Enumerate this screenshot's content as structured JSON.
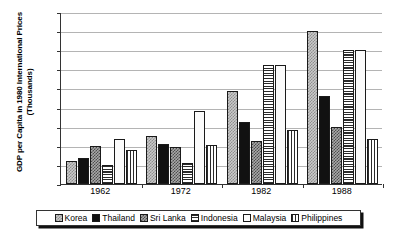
{
  "chart_data": {
    "type": "bar",
    "title": "",
    "subtitle": "",
    "xlabel": "",
    "ylabel": "GDP per Capita in 1980 International Prices",
    "ylabel_line2": "(Thousands)",
    "categories": [
      "1962",
      "1972",
      "1982",
      "1988"
    ],
    "ylim": [
      0,
      4500
    ],
    "ytick_step": 500,
    "ytick_labels": [
      "4500",
      "4000",
      "3500",
      "3000",
      "2500",
      "2000",
      "1500",
      "1000",
      "500",
      "0"
    ],
    "grid": true,
    "legend_position": "bottom",
    "series": [
      {
        "name": "Korea",
        "pattern": "checker-light",
        "values": [
          600,
          1260,
          2440,
          4000
        ]
      },
      {
        "name": "Thailand",
        "pattern": "solid-black",
        "values": [
          690,
          1050,
          1630,
          2300
        ]
      },
      {
        "name": "Sri Lanka",
        "pattern": "checker-dark",
        "values": [
          990,
          960,
          1120,
          1500
        ]
      },
      {
        "name": "Indonesia",
        "pattern": "horizontal-lines",
        "values": [
          490,
          550,
          3120,
          3500
        ]
      },
      {
        "name": "Malaysia",
        "pattern": "solid-white",
        "values": [
          1180,
          1900,
          3110,
          3500
        ]
      },
      {
        "name": "Philippines",
        "pattern": "vertical-lines",
        "values": [
          880,
          1030,
          1410,
          1180
        ]
      }
    ]
  },
  "colors": {
    "axis": "#333333",
    "gridline": "#b4b4b4",
    "background": "#ffffff",
    "bar_outline": "#1a1a1a"
  }
}
